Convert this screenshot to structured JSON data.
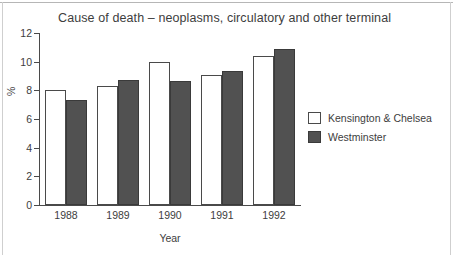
{
  "chart_data": {
    "type": "bar",
    "title": "Cause of death – neoplasms, circulatory and other terminal",
    "xlabel": "Year",
    "ylabel": "%",
    "categories": [
      "1988",
      "1989",
      "1990",
      "1991",
      "1992"
    ],
    "series": [
      {
        "name": "Kensington & Chelsea",
        "color": "#ffffff",
        "values": [
          8.05,
          8.3,
          10.0,
          9.05,
          10.4
        ]
      },
      {
        "name": "Westminster",
        "color": "#515151",
        "values": [
          7.3,
          8.75,
          8.65,
          9.35,
          10.9
        ]
      }
    ],
    "ylim": [
      0,
      12
    ],
    "yticks": [
      0,
      2,
      4,
      6,
      8,
      10,
      12
    ],
    "ytick_labels": [
      "0",
      "2",
      "4",
      "6",
      "8",
      "10",
      "12"
    ],
    "grid": false,
    "legend_position": "right"
  }
}
